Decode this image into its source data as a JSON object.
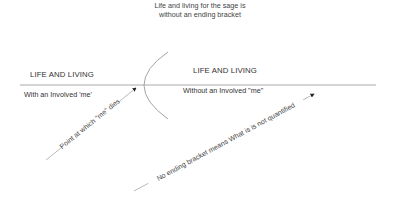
{
  "title": {
    "line1": "Life and living for the sage is",
    "line2": "without an ending bracket"
  },
  "left_section": {
    "heading": "LIFE AND LIVING",
    "subtext": "With an Involved 'me'"
  },
  "right_section": {
    "heading": "LIFE AND LIVING",
    "subtext": "Without an Involved \"me\""
  },
  "annotations": {
    "death_point": "Point at which \"me\" dies",
    "no_bracket": "No ending bracket means What is is not quantified"
  },
  "colors": {
    "line": "#aaaaaa",
    "arc": "#999999",
    "text": "#333333",
    "arrow": "#222222"
  }
}
